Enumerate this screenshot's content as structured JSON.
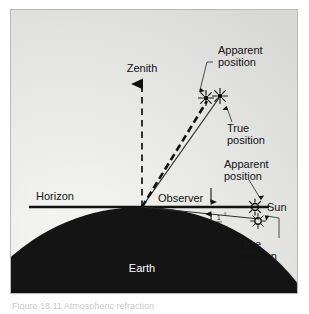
{
  "figure": {
    "type": "astronomy-refraction-diagram",
    "background_color": "#e9e9e7",
    "frame_border_color": "#b9b9b9",
    "earth_color": "#141414",
    "line_color": "#111111",
    "labels": {
      "zenith": "Zenith",
      "horizon": "Horizon",
      "observer": "Observer",
      "earth": "Earth",
      "sun": "Sun",
      "apparent_position_upper": "Apparent\nposition",
      "apparent_position_upper_line1": "Apparent",
      "apparent_position_upper_line2": "position",
      "true_position_upper_line1": "True",
      "true_position_upper_line2": "position",
      "apparent_position_lower_line1": "Apparent",
      "apparent_position_lower_line2": "position",
      "true_position_lower_line1": "True",
      "true_position_lower_line2": "position",
      "angle_numerator": "1",
      "angle_denominator": "2",
      "angle_degree_symbol": "°",
      "angle_full": "1/2°"
    },
    "icons": {
      "star_apparent_upper": "star-burst-icon",
      "star_true_upper": "star-burst-icon",
      "sun_apparent_lower": "sun-burst-icon",
      "sun_true_lower": "sun-burst-icon",
      "zenith_arrow": "arrow-up-icon",
      "angle_arrow_top": "arrow-down-icon",
      "angle_arrow_bottom": "arrow-up-icon"
    },
    "elements_described": [
      "dashed vertical zenith arrow from observer",
      "thick dashed ray to apparent star position",
      "thin solid ray to true star position",
      "solid horizon line",
      "thick horizontal line to apparent sun position",
      "thin line to true sun position below horizon",
      "half-degree refraction angle marker",
      "black circular Earth"
    ]
  },
  "caption": {
    "text": "Figure 18.11  Atmospheric refraction"
  }
}
